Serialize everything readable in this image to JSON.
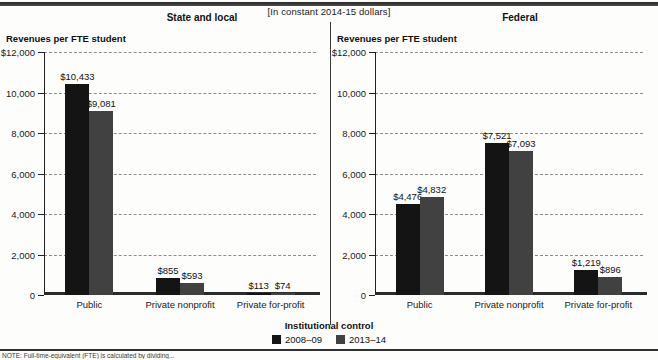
{
  "figure": {
    "units_note": "[In constant 2014-15 dollars]",
    "legend_title": "Institutional control",
    "note": "NOTE: Full-time-equivalent (FTE) is calculated by dividing...",
    "series_colors": [
      "#141414",
      "#414141"
    ]
  },
  "legend": {
    "items": [
      {
        "label": "2008–09",
        "color": "#141414"
      },
      {
        "label": "2013–14",
        "color": "#414141"
      }
    ]
  },
  "chart_data": [
    {
      "type": "bar",
      "title": "State and local",
      "ylabel": "Revenues per FTE student",
      "xlabel": "Institutional control",
      "categories": [
        "Public",
        "Private nonprofit",
        "Private for-profit"
      ],
      "series": [
        {
          "name": "2008–09",
          "values": [
            10433,
            855,
            113
          ],
          "labels": [
            "$10,433",
            "$855",
            "$113"
          ]
        },
        {
          "name": "2013–14",
          "values": [
            9081,
            593,
            74
          ],
          "labels": [
            "$9,081",
            "$593",
            "$74"
          ]
        }
      ],
      "ylim": [
        0,
        12000
      ],
      "yticks": [
        0,
        2000,
        4000,
        6000,
        8000,
        10000,
        12000
      ],
      "yticklabels": [
        "0",
        "2,000",
        "4,000",
        "6,000",
        "8,000",
        "10,000",
        "$12,000"
      ],
      "grid": true,
      "legend_position": "bottom"
    },
    {
      "type": "bar",
      "title": "Federal",
      "ylabel": "Revenues per FTE student",
      "xlabel": "Institutional control",
      "categories": [
        "Public",
        "Private nonprofit",
        "Private for-profit"
      ],
      "series": [
        {
          "name": "2008–09",
          "values": [
            4476,
            7521,
            1219
          ],
          "labels": [
            "$4,476",
            "$7,521",
            "$1,219"
          ]
        },
        {
          "name": "2013–14",
          "values": [
            4832,
            7093,
            896
          ],
          "labels": [
            "$4,832",
            "$7,093",
            "$896"
          ]
        }
      ],
      "ylim": [
        0,
        12000
      ],
      "yticks": [
        0,
        2000,
        4000,
        6000,
        8000,
        10000,
        12000
      ],
      "yticklabels": [
        "0",
        "2,000",
        "4,000",
        "6,000",
        "8,000",
        "10,000",
        "$12,000"
      ],
      "grid": true,
      "legend_position": "bottom"
    }
  ]
}
